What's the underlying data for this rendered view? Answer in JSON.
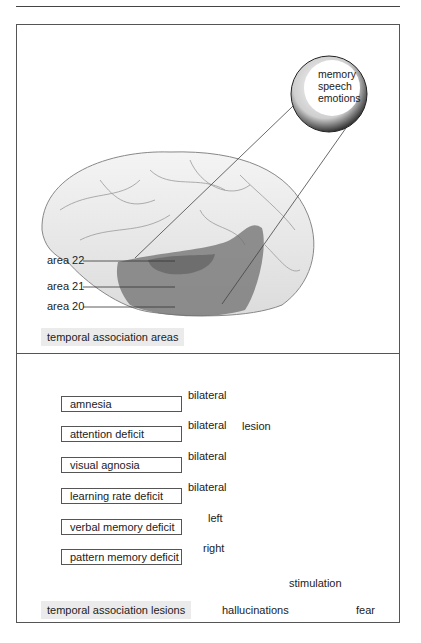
{
  "header": {
    "rule": true
  },
  "top_panel": {
    "label": "temporal association areas",
    "callout": [
      "memory",
      "speech",
      "emotions"
    ],
    "areas": [
      {
        "label": "area 22"
      },
      {
        "label": "area 21"
      },
      {
        "label": "area 20"
      }
    ]
  },
  "bottom_panel": {
    "label": "temporal association lesions",
    "deficits": [
      {
        "label": "amnesia",
        "side": "bilateral"
      },
      {
        "label": "attention deficit",
        "side": "bilateral"
      },
      {
        "label": "visual agnosia",
        "side": "bilateral"
      },
      {
        "label": "learning rate deficit",
        "side": "bilateral"
      },
      {
        "label": "verbal memory deficit",
        "side": "left"
      },
      {
        "label": "pattern memory deficit",
        "side": "right"
      }
    ],
    "lesion_label": "lesion",
    "stimulation": {
      "label": "stimulation",
      "outcomes": [
        "hallucinations",
        "fear"
      ]
    }
  },
  "colors": {
    "line": "#444444",
    "highlight": "#7a7a7a",
    "lesion": "#222222",
    "label_bg": "#ebebeb"
  }
}
